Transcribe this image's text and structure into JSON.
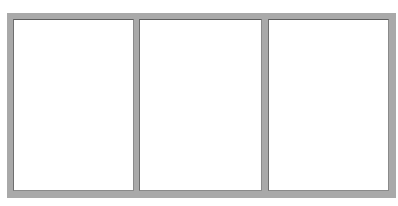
{
  "frame": {
    "color": "#a9a9a9",
    "panel_count": 3
  },
  "panels": [
    {
      "label": "",
      "background": "#ffffff"
    },
    {
      "label": "",
      "background": "#ffffff"
    },
    {
      "label": "",
      "background": "#ffffff"
    }
  ]
}
